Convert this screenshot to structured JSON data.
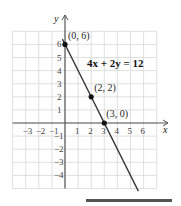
{
  "chart_data": {
    "type": "line",
    "title": "",
    "xlabel": "x",
    "ylabel": "y",
    "xlim": [
      -4,
      7
    ],
    "ylim": [
      -5,
      7
    ],
    "grid": true,
    "x_ticks": [
      "-3",
      "-2",
      "-1",
      "1",
      "2",
      "3",
      "4",
      "5",
      "6"
    ],
    "y_ticks": [
      "-4",
      "-3",
      "-2",
      "-1",
      "1",
      "2",
      "3",
      "4",
      "5",
      "6"
    ],
    "equation": "4x + 2y = 12",
    "series": [
      {
        "name": "4x + 2y = 12",
        "x": [
          -0.2,
          5.6
        ],
        "y": [
          6.4,
          -5.2
        ]
      }
    ],
    "points": [
      {
        "label": "(0, 6)",
        "x": 0,
        "y": 6
      },
      {
        "label": "(2, 2)",
        "x": 2,
        "y": 2
      },
      {
        "label": "(3, 0)",
        "x": 3,
        "y": 0
      }
    ]
  },
  "colors": {
    "grid": "#d8d8d8",
    "axis": "#555555",
    "line": "#333333",
    "bar": "#555555"
  }
}
